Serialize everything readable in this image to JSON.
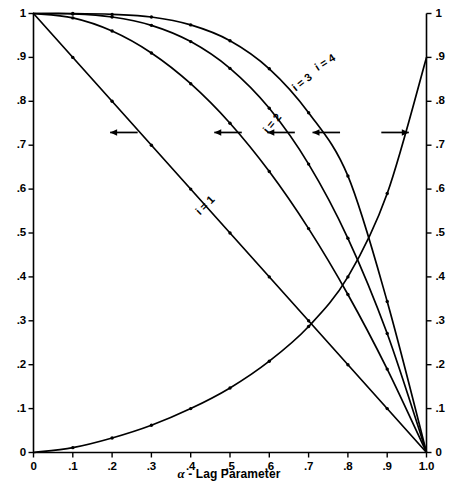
{
  "chart_data": {
    "type": "line",
    "title": "",
    "subtitle": "",
    "xlabel": "α - Lag Parameter",
    "ylabel": "",
    "xlim": [
      0,
      1
    ],
    "ylim": [
      0,
      1
    ],
    "grid": false,
    "legend_position": "inline-curve-labels",
    "x_ticks": [
      "0",
      ".1",
      ".2",
      ".3",
      ".4",
      ".5",
      ".6",
      ".7",
      ".8",
      ".9",
      "1.0"
    ],
    "x_tick_values": [
      0,
      0.1,
      0.2,
      0.3,
      0.4,
      0.5,
      0.6,
      0.7,
      0.8,
      0.9,
      1.0
    ],
    "y_ticks_left": [
      "0",
      ".1",
      ".2",
      ".3",
      ".4",
      ".5",
      ".6",
      ".7",
      ".8",
      ".9",
      "1"
    ],
    "y_tick_values_left": [
      0,
      0.1,
      0.2,
      0.3,
      0.4,
      0.5,
      0.6,
      0.7,
      0.8,
      0.9,
      1.0
    ],
    "y_ticks_right": [
      "0",
      ".1",
      ".2",
      ".3",
      ".4",
      ".5",
      ".6",
      ".7",
      ".8",
      ".9",
      "1"
    ],
    "y_tick_values_right": [
      0,
      0.1,
      0.2,
      0.3,
      0.4,
      0.5,
      0.6,
      0.7,
      0.8,
      0.9,
      1.0
    ],
    "x": [
      0,
      0.1,
      0.2,
      0.3,
      0.4,
      0.5,
      0.6,
      0.7,
      0.8,
      0.9,
      1.0
    ],
    "series": [
      {
        "name": "i = 1",
        "axis": "left",
        "label": "i = 1",
        "marker": "dot",
        "values": [
          1.0,
          0.9,
          0.8,
          0.7,
          0.6,
          0.5,
          0.4,
          0.3,
          0.2,
          0.1,
          0.0
        ]
      },
      {
        "name": "i = 2",
        "axis": "left",
        "label": "i = 2",
        "marker": "dot",
        "values": [
          1.0,
          0.99,
          0.96,
          0.91,
          0.84,
          0.75,
          0.64,
          0.51,
          0.36,
          0.19,
          0.0
        ]
      },
      {
        "name": "i = 3",
        "axis": "left",
        "label": "i = 3",
        "marker": "dot",
        "values": [
          1.0,
          0.999,
          0.992,
          0.973,
          0.936,
          0.875,
          0.784,
          0.657,
          0.488,
          0.271,
          0.0
        ]
      },
      {
        "name": "i = 4",
        "axis": "left",
        "label": "i = 4",
        "marker": "dot",
        "values": [
          1.0,
          1.0,
          0.998,
          0.992,
          0.974,
          0.938,
          0.874,
          0.774,
          0.63,
          0.344,
          0.0
        ]
      },
      {
        "name": "mean-lag",
        "axis": "right",
        "label": "",
        "marker": "dot",
        "values": [
          0.0,
          0.011,
          0.033,
          0.062,
          0.1,
          0.147,
          0.208,
          0.287,
          0.4,
          0.59,
          0.9
        ]
      }
    ],
    "annotations": [
      {
        "text": "i = 1",
        "x": 0.44,
        "y": 0.56,
        "rotation": -45
      },
      {
        "text": "i = 2",
        "x": 0.61,
        "y": 0.745,
        "rotation": -50
      },
      {
        "text": "i = 3",
        "x": 0.685,
        "y": 0.84,
        "rotation": -38
      },
      {
        "text": "i = 4",
        "x": 0.745,
        "y": 0.885,
        "rotation": -32
      }
    ],
    "axis_arrows": [
      {
        "direction": "left",
        "x_start": 0.265,
        "x_end": 0.195,
        "y": 0.729
      },
      {
        "direction": "left",
        "x_start": 0.53,
        "x_end": 0.46,
        "y": 0.729
      },
      {
        "direction": "left",
        "x_start": 0.665,
        "x_end": 0.595,
        "y": 0.729
      },
      {
        "direction": "left",
        "x_start": 0.78,
        "x_end": 0.71,
        "y": 0.729
      },
      {
        "direction": "right",
        "x_start": 0.885,
        "x_end": 0.955,
        "y": 0.729
      }
    ]
  },
  "colors": {
    "axis": "#000000",
    "curve": "#000000",
    "background": "#ffffff",
    "text": "#000000"
  }
}
